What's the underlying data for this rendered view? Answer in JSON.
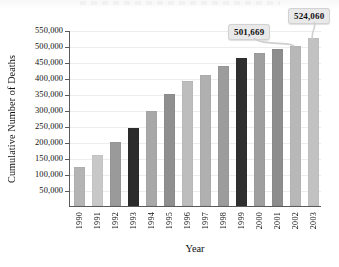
{
  "chart_data": {
    "type": "bar",
    "title": "",
    "xlabel": "Year",
    "ylabel": "Cumulative Number of Deaths",
    "categories": [
      "1990",
      "1991",
      "1992",
      "1993",
      "1994",
      "1995",
      "1996",
      "1997",
      "1998",
      "1999",
      "2000",
      "2001",
      "2002",
      "2003"
    ],
    "values": [
      121000,
      158000,
      199000,
      245000,
      296000,
      350000,
      391000,
      411000,
      438000,
      462000,
      478000,
      492000,
      501669,
      524060
    ],
    "ylim": [
      0,
      550000
    ],
    "ytick_labels": [
      "50,000",
      "100,000",
      "150,000",
      "200,000",
      "250,000",
      "300,000",
      "350,000",
      "400,000",
      "450,000",
      "500,000",
      "550,000"
    ],
    "ytick_values": [
      50000,
      100000,
      150000,
      200000,
      250000,
      300000,
      350000,
      400000,
      450000,
      500000,
      550000
    ],
    "grid": true,
    "legend": "none",
    "bar_colors": [
      "#b4b4b4",
      "#c8c8c8",
      "#9a9a9a",
      "#2c2c2c",
      "#a8a8a8",
      "#8f8f8f",
      "#bdbdbd",
      "#b0b0b0",
      "#9c9c9c",
      "#2f2f2f",
      "#9f9f9f",
      "#8d8d8d",
      "#b8b8b8",
      "#c2c2c2"
    ],
    "annotations": [
      {
        "label": "501,669",
        "category": "2002",
        "value": 501669
      },
      {
        "label": "524,060",
        "category": "2003",
        "value": 524060
      }
    ]
  },
  "axis": {
    "y_title": "Cumulative Number of Deaths",
    "x_title": "Year"
  }
}
